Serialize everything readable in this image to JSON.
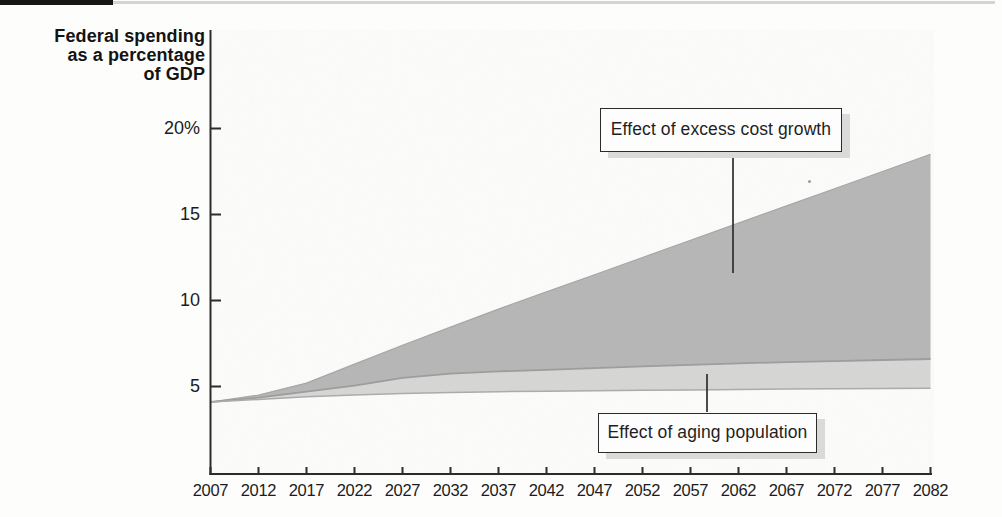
{
  "figure": {
    "description_visible_text_only": true
  },
  "y_axis": {
    "title_lines": [
      "Federal spending",
      "as a percentage",
      "of GDP"
    ],
    "tick_labels": [
      "20%",
      "15",
      "10",
      "5"
    ],
    "tick_values": [
      20,
      15,
      10,
      5
    ]
  },
  "x_axis": {
    "tick_labels": [
      "2007",
      "2012",
      "2017",
      "2022",
      "2027",
      "2032",
      "2037",
      "2042",
      "2047",
      "2052",
      "2057",
      "2062",
      "2067",
      "2072",
      "2077",
      "2082"
    ]
  },
  "annotations": {
    "excess_label": "Effect of excess cost growth",
    "aging_label": "Effect of aging population"
  },
  "colors": {
    "background": "#fdfdfc",
    "axis": "#2c2c2c",
    "text": "#1c1c1c",
    "area_excess_cost_growth": "#b7b7b7",
    "area_aging_population": "#d7d7d6",
    "boundary_line": "#9d9d9d",
    "callout_border": "#2b2b2b",
    "callout_shadow": "#dadad9"
  },
  "chart_data": {
    "type": "area",
    "title": "",
    "ylabel": "Federal spending as a percentage of GDP",
    "xlabel": "",
    "xlim": [
      2007,
      2082
    ],
    "ylim": [
      0,
      21
    ],
    "grid": false,
    "legend": "inline callout boxes with leader lines",
    "x": [
      2007,
      2012,
      2017,
      2022,
      2027,
      2032,
      2037,
      2042,
      2047,
      2052,
      2057,
      2062,
      2067,
      2072,
      2077,
      2082
    ],
    "series": [
      {
        "name": "baseline-spending-lower-boundary",
        "role": "bottom edge of shaded region (unshaded below)",
        "values": [
          4.1,
          4.25,
          4.4,
          4.5,
          4.6,
          4.65,
          4.7,
          4.72,
          4.75,
          4.78,
          4.8,
          4.83,
          4.85,
          4.87,
          4.88,
          4.9
        ]
      },
      {
        "name": "effect-of-aging-population-upper-boundary",
        "role": "top edge of light band; light band = effect of aging population",
        "label": "Effect of aging population",
        "values": [
          4.1,
          4.35,
          4.7,
          5.05,
          5.5,
          5.75,
          5.88,
          5.97,
          6.07,
          6.17,
          6.26,
          6.34,
          6.42,
          6.48,
          6.54,
          6.6
        ]
      },
      {
        "name": "total-spending-upper-boundary",
        "role": "top edge of dark area; dark area = effect of excess cost growth",
        "label": "Effect of excess cost growth",
        "values": [
          4.1,
          4.5,
          5.2,
          6.3,
          7.4,
          8.45,
          9.5,
          10.5,
          11.5,
          12.5,
          13.5,
          14.5,
          15.5,
          16.5,
          17.5,
          18.5
        ]
      }
    ]
  }
}
